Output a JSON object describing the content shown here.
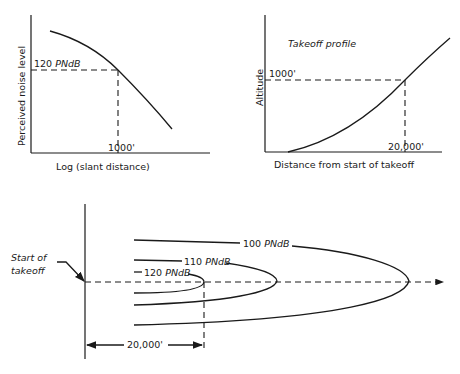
{
  "panel_noise": {
    "y_label": "Perceived noise level",
    "x_label": "Log (slant distance)",
    "level_label_num": "120",
    "level_label_unit": "PNdB",
    "distance_label": "1000'"
  },
  "panel_profile": {
    "title": "Takeoff profile",
    "y_label": "Altitude",
    "x_label": "Distance from start of takeoff",
    "altitude_label": "1000'",
    "distance_label": "20,000'"
  },
  "panel_contours": {
    "start_label_line1": "Start of",
    "start_label_line2": "takeoff",
    "contours": [
      {
        "num": "100",
        "unit": "PNdB"
      },
      {
        "num": "110",
        "unit": "PNdB"
      },
      {
        "num": "120",
        "unit": "PNdB"
      }
    ],
    "dimension_label": "20,000'"
  },
  "colors": {
    "ink": "#1a1a1a",
    "background": "#ffffff"
  }
}
